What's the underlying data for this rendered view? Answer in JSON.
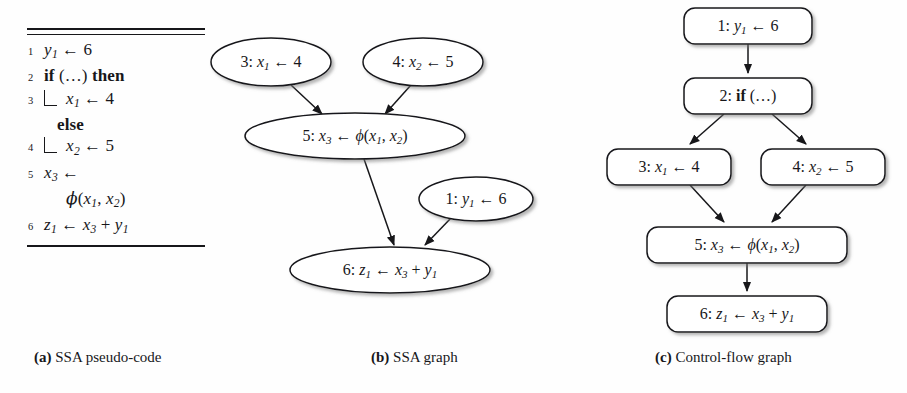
{
  "figure": {
    "width": 907,
    "height": 393,
    "background": "#fefefe",
    "ink": "#17171a"
  },
  "panel_a": {
    "caption_marker": "(a)",
    "caption_text": "SSA pseudo-code",
    "lines": [
      {
        "no": "1",
        "kind": "stmt",
        "text": "y1 ← 6"
      },
      {
        "no": "2",
        "kind": "kw",
        "text": "if (…) then"
      },
      {
        "no": "3",
        "kind": "block",
        "text": "x1 ← 4"
      },
      {
        "no": "",
        "kind": "kw",
        "text": "else"
      },
      {
        "no": "4",
        "kind": "block",
        "text": "x2 ← 5"
      },
      {
        "no": "5",
        "kind": "stmt",
        "text": "x3 ←"
      },
      {
        "no": "",
        "kind": "cont",
        "text": "ϕ(x1, x2)"
      },
      {
        "no": "6",
        "kind": "stmt",
        "text": "z1 ← x3 + y1"
      }
    ]
  },
  "panel_b": {
    "caption_marker": "(b)",
    "caption_text": "SSA graph",
    "node_shape": "ellipse",
    "nodes": [
      {
        "id": "n3",
        "label": "3: x1 ← 4",
        "cx": 271,
        "cy": 62,
        "rx": 60,
        "ry": 24
      },
      {
        "id": "n4",
        "label": "4: x2 ← 5",
        "cx": 423,
        "cy": 62,
        "rx": 60,
        "ry": 24
      },
      {
        "id": "n5",
        "label": "5: x3 ← ϕ(x1, x2)",
        "cx": 355,
        "cy": 136,
        "rx": 110,
        "ry": 23
      },
      {
        "id": "n1",
        "label": "1: y1 ← 6",
        "cx": 476,
        "cy": 199,
        "rx": 57,
        "ry": 22
      },
      {
        "id": "n6",
        "label": "6: z1 ← x3 + y1",
        "cx": 390,
        "cy": 270,
        "rx": 100,
        "ry": 23
      }
    ],
    "edges": [
      {
        "from": "n3",
        "to": "n5"
      },
      {
        "from": "n4",
        "to": "n5"
      },
      {
        "from": "n5",
        "to": "n6"
      },
      {
        "from": "n1",
        "to": "n6"
      }
    ]
  },
  "panel_c": {
    "caption_marker": "(c)",
    "caption_text": "Control-flow graph",
    "node_shape": "rounded-rect",
    "nodes": [
      {
        "id": "b1",
        "label": "1: y1 ← 6",
        "x": 684,
        "y": 8,
        "w": 128,
        "h": 36
      },
      {
        "id": "b2",
        "label": "2: if (…)",
        "x": 684,
        "y": 78,
        "w": 128,
        "h": 36
      },
      {
        "id": "b3",
        "label": "3: x1 ← 4",
        "x": 607,
        "y": 149,
        "w": 124,
        "h": 36
      },
      {
        "id": "b4",
        "label": "4: x2 ← 5",
        "x": 761,
        "y": 149,
        "w": 124,
        "h": 36
      },
      {
        "id": "b5",
        "label": "5: x3 ← ϕ(x1, x2)",
        "x": 647,
        "y": 227,
        "w": 200,
        "h": 36
      },
      {
        "id": "b6",
        "label": "6: z1 ← x3 + y1",
        "x": 667,
        "y": 296,
        "w": 160,
        "h": 36
      }
    ],
    "edges": [
      {
        "from": "b1",
        "to": "b2"
      },
      {
        "from": "b2",
        "to": "b3"
      },
      {
        "from": "b2",
        "to": "b4"
      },
      {
        "from": "b3",
        "to": "b5"
      },
      {
        "from": "b4",
        "to": "b5"
      },
      {
        "from": "b5",
        "to": "b6"
      }
    ]
  }
}
